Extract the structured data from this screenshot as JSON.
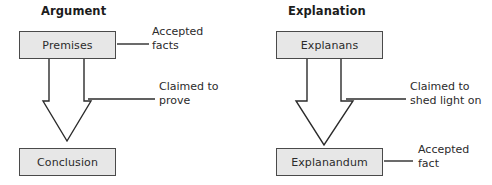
{
  "figure": {
    "background_color": "#ffffff",
    "box_fill_color": "#e7e7e7",
    "box_border_color": "#4a4a4a",
    "arrow_fill_color": "#ffffff",
    "arrow_border_color": "#2b2b2b",
    "text_color": "#2b2b2b",
    "title_color": "#1c1c1c"
  },
  "panels": [
    {
      "title": "Argument",
      "top_node": "Premises",
      "bottom_node": "Conclusion",
      "top_annotation_line1": "Accepted",
      "top_annotation_line2": "facts",
      "arrow_annotation_line1": "Claimed to",
      "arrow_annotation_line2": "prove"
    },
    {
      "title": "Explanation",
      "top_node": "Explanans",
      "bottom_node": "Explanandum",
      "arrow_annotation_line1": "Claimed to",
      "arrow_annotation_line2": "shed light on",
      "bottom_annotation_line1": "Accepted",
      "bottom_annotation_line2": "fact"
    }
  ]
}
